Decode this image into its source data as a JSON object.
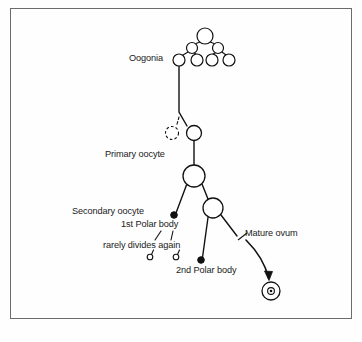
{
  "figure": {
    "frame": {
      "stroke": "#6b6b6b",
      "x": 10,
      "y": 8,
      "width": 342,
      "height": 311
    },
    "background": "#fefefe",
    "line_color": "#111111",
    "text_color": "#1a1a1a"
  },
  "labels": [
    {
      "id": "oogonia",
      "text": "Oogonia",
      "x": 129,
      "y": 58,
      "anchor": "start"
    },
    {
      "id": "primary",
      "text": "Primary oocyte",
      "x": 105,
      "y": 155,
      "anchor": "start"
    },
    {
      "id": "secondary",
      "text": "Secondary oocyte",
      "x": 72,
      "y": 212,
      "anchor": "start"
    },
    {
      "id": "first-polar",
      "text": "1st Polar body",
      "x": 121,
      "y": 225,
      "anchor": "start"
    },
    {
      "id": "rarely-divides",
      "text": "rarely divides again",
      "x": 103,
      "y": 246,
      "anchor": "start"
    },
    {
      "id": "second-polar",
      "text": "2nd Polar body",
      "x": 176,
      "y": 271,
      "anchor": "start"
    },
    {
      "id": "mature-ovum",
      "text": "Mature ovum",
      "x": 243,
      "y": 234,
      "anchor": "start"
    }
  ],
  "cells": {
    "oogonia_cluster": [
      {
        "id": "oogonia-apex",
        "cx": 205,
        "cy": 36,
        "r": 8.0,
        "style": "solid"
      },
      {
        "id": "oogonia-midleft",
        "cx": 192,
        "cy": 48,
        "r": 5.5,
        "style": "solid"
      },
      {
        "id": "oogonia-midright",
        "cx": 218,
        "cy": 48,
        "r": 5.5,
        "style": "solid"
      },
      {
        "id": "oogonia-leaf-1",
        "cx": 179,
        "cy": 60,
        "r": 6.0,
        "style": "solid"
      },
      {
        "id": "oogonia-leaf-2",
        "cx": 197,
        "cy": 60,
        "r": 6.0,
        "style": "solid"
      },
      {
        "id": "oogonia-leaf-3",
        "cx": 211,
        "cy": 60,
        "r": 6.0,
        "style": "solid"
      },
      {
        "id": "oogonia-leaf-4",
        "cx": 228,
        "cy": 60,
        "r": 6.0,
        "style": "solid"
      }
    ],
    "degenerating_oocyte": {
      "id": "degenerating-oocyte",
      "cx": 172,
      "cy": 133,
      "r": 6.5,
      "style": "dashed"
    },
    "primary_oocyte": {
      "id": "primary-oocyte",
      "cx": 194,
      "cy": 133,
      "r": 7.5,
      "style": "solid"
    },
    "secondary_oocyte": {
      "id": "secondary-oocyte",
      "cx": 194,
      "cy": 177,
      "r": 11.0,
      "style": "solid"
    },
    "ootid": {
      "id": "ootid-cell",
      "cx": 213,
      "cy": 208,
      "r": 10.0,
      "style": "solid"
    },
    "first_polar_body": {
      "id": "first-polar-body",
      "cx": 174,
      "cy": 216,
      "r": 3.2,
      "style": "filled"
    },
    "second_polar_body": {
      "id": "second-polar-body",
      "cx": 201,
      "cy": 261,
      "r": 3.2,
      "style": "filled"
    },
    "polar_daughters": [
      {
        "id": "polar-daughter-left",
        "cx": 150,
        "cy": 257,
        "r": 2.6,
        "style": "solid"
      },
      {
        "id": "polar-daughter-right",
        "cx": 175,
        "cy": 257,
        "r": 2.6,
        "style": "solid"
      }
    ],
    "mature_ovum": {
      "id": "mature-ovum-cell",
      "cx": 271,
      "cy": 291,
      "r": 9.0,
      "nucleus_r": 3.2,
      "inner_r": 1.4,
      "style": "nucleated"
    }
  },
  "connectors": {
    "oogonia_to_primary": "M 179 66 L 179 112 L 187 126",
    "branch_to_degenerating": "M 179 118 L 176 127",
    "primary_to_secondary": "M 194 141 L 194 166",
    "secondary_to_first_polar": "M 186 185 L 176 213",
    "secondary_to_ootid": "M 202 185 L 207 199",
    "ootid_to_second_polar": "M 208 217 L 202 258",
    "ootid_to_ovum": "M 220 217 L 236 237",
    "polar_tick_left": "M 150 254 L 152 249",
    "polar_tick_right": "M 175 254 L 177 249",
    "rarely_arrow_left": "M 154 243 L 160 234",
    "rarely_arrow_right": "M 170 243 L 172 234",
    "ovum_pointer": "M 255 236 L 243 231",
    "ovum_arrow": "M 248 240 Q 262 262 268 280"
  },
  "colors": {
    "stroke": "#111111",
    "frame": "#6b6b6b",
    "fill": "#ffffff",
    "text": "#1a1a1a"
  }
}
